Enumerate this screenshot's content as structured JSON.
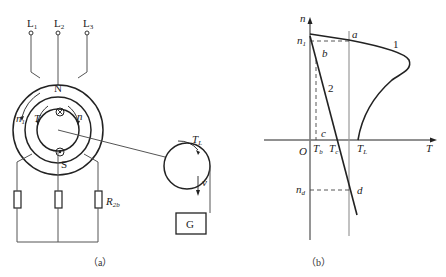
{
  "figure_a": {
    "caption": "（a）",
    "terminals": [
      "L",
      "L",
      "L"
    ],
    "terminal_subs": [
      "1",
      "2",
      "3"
    ],
    "pole_north": "N",
    "pole_south": "S",
    "speed_field_label": "n",
    "speed_field_sub": "1",
    "torque_label": "T",
    "rotor_speed_label": "n",
    "resistor_label": "R",
    "resistor_sub": "2b",
    "load_torque_label": "T",
    "load_torque_sub": "L",
    "velocity_label": "v",
    "weight_label": "G"
  },
  "figure_b": {
    "caption": "（b）",
    "y_axis_label": "n",
    "x_axis_label": "T",
    "origin_label": "O",
    "n1_label": "n",
    "n1_sub": "1",
    "nd_label": "n",
    "nd_sub": "d",
    "point_a": "a",
    "point_b": "b",
    "point_c": "c",
    "point_d": "d",
    "curve1_label": "1",
    "curve2_label": "2",
    "tb_label": "T",
    "tb_sub": "b",
    "tc_label": "T",
    "tc_sub": "c",
    "tl_label": "T",
    "tl_sub": "L"
  }
}
